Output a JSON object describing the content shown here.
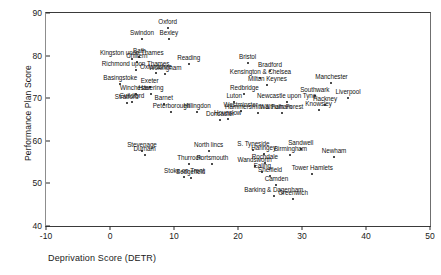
{
  "chart_data": {
    "type": "scatter",
    "title": "",
    "xlabel": "Deprivation Score (DETR)",
    "ylabel": "Performance Plan Score",
    "xlim": [
      -10,
      50
    ],
    "ylim": [
      40,
      90
    ],
    "xticks": [
      -10,
      0,
      10,
      20,
      30,
      40,
      50
    ],
    "yticks": [
      40,
      50,
      60,
      70,
      80,
      90
    ],
    "grid": false,
    "legend": null,
    "marker_color": "#111111",
    "axis_color": "#2b2b2b",
    "points": [
      {
        "label": "Oxford",
        "x": 9.0,
        "y": 86.5
      },
      {
        "label": "Swindon",
        "x": 5.0,
        "y": 84.0
      },
      {
        "label": "Bexley",
        "x": 9.2,
        "y": 84.0
      },
      {
        "label": "Bath",
        "x": 4.6,
        "y": 79.6
      },
      {
        "label": "Kingston upon Thames",
        "x": 3.4,
        "y": 79.2
      },
      {
        "label": "Chiltern",
        "x": 4.2,
        "y": 78.6
      },
      {
        "label": "Reading",
        "x": 12.3,
        "y": 78.0
      },
      {
        "label": "Bristol",
        "x": 21.5,
        "y": 78.2
      },
      {
        "label": "Richmond upon Thames",
        "x": 4.0,
        "y": 76.6
      },
      {
        "label": "Oxfordshire",
        "x": 7.2,
        "y": 76.0
      },
      {
        "label": "Wokingham",
        "x": 8.6,
        "y": 75.6
      },
      {
        "label": "Bradford",
        "x": 25.0,
        "y": 76.4
      },
      {
        "label": "Kensington & Chelsea",
        "x": 23.5,
        "y": 74.8
      },
      {
        "label": "Basingstoke",
        "x": 1.6,
        "y": 73.4
      },
      {
        "label": "Exeter",
        "x": 6.2,
        "y": 72.6
      },
      {
        "label": "Milton Keynes",
        "x": 24.6,
        "y": 73.0
      },
      {
        "label": "Manchester",
        "x": 34.6,
        "y": 73.6
      },
      {
        "label": "Winchester",
        "x": 4.0,
        "y": 71.0
      },
      {
        "label": "Havering",
        "x": 6.4,
        "y": 71.0
      },
      {
        "label": "Redbridge",
        "x": 21.0,
        "y": 71.0
      },
      {
        "label": "Southwark",
        "x": 32.0,
        "y": 70.6
      },
      {
        "label": "Liverpool",
        "x": 37.2,
        "y": 70.0
      },
      {
        "label": "Guildford",
        "x": 3.4,
        "y": 69.0
      },
      {
        "label": "Stratford",
        "x": 2.6,
        "y": 68.8
      },
      {
        "label": "Barnet",
        "x": 8.4,
        "y": 68.6
      },
      {
        "label": "Luton",
        "x": 19.4,
        "y": 69.0
      },
      {
        "label": "Newcastle upon Tyne",
        "x": 27.6,
        "y": 69.2
      },
      {
        "label": "Hackney",
        "x": 33.6,
        "y": 68.4
      },
      {
        "label": "Knowsley",
        "x": 32.6,
        "y": 67.2
      },
      {
        "label": "Peterborough",
        "x": 9.6,
        "y": 66.8
      },
      {
        "label": "Hillingdon",
        "x": 13.6,
        "y": 66.8
      },
      {
        "label": "Westminster",
        "x": 20.4,
        "y": 67.0
      },
      {
        "label": "Hammersmith & Fulham",
        "x": 23.2,
        "y": 66.6
      },
      {
        "label": "Waltham Forest",
        "x": 26.8,
        "y": 66.6
      },
      {
        "label": "Hounslow",
        "x": 18.4,
        "y": 65.2
      },
      {
        "label": "Doncaster",
        "x": 17.2,
        "y": 65.0
      },
      {
        "label": "Stevenage",
        "x": 5.0,
        "y": 57.6
      },
      {
        "label": "Durham",
        "x": 5.4,
        "y": 56.6
      },
      {
        "label": "North lincs",
        "x": 15.4,
        "y": 57.6
      },
      {
        "label": "S. Tyneside",
        "x": 22.4,
        "y": 57.8
      },
      {
        "label": "Sandwell",
        "x": 29.8,
        "y": 58.0
      },
      {
        "label": "Haringey",
        "x": 24.0,
        "y": 56.8
      },
      {
        "label": "Birmingham",
        "x": 28.2,
        "y": 56.6
      },
      {
        "label": "Newham",
        "x": 35.0,
        "y": 56.2
      },
      {
        "label": "Thurrock",
        "x": 12.4,
        "y": 54.6
      },
      {
        "label": "Portsmouth",
        "x": 16.0,
        "y": 54.6
      },
      {
        "label": "Rochdale",
        "x": 24.2,
        "y": 54.8
      },
      {
        "label": "Wandsworth",
        "x": 22.6,
        "y": 54.2
      },
      {
        "label": "Ealing",
        "x": 23.8,
        "y": 52.6
      },
      {
        "label": "Sheffield",
        "x": 25.0,
        "y": 51.8
      },
      {
        "label": "Tower Hamlets",
        "x": 31.6,
        "y": 52.2
      },
      {
        "label": "Stoke on Trent",
        "x": 11.6,
        "y": 51.4
      },
      {
        "label": "Sedgefield",
        "x": 12.6,
        "y": 51.2
      },
      {
        "label": "Camden",
        "x": 26.0,
        "y": 49.6
      },
      {
        "label": "Barking & Dagenham",
        "x": 25.6,
        "y": 47.0
      },
      {
        "label": "Greenwich",
        "x": 28.6,
        "y": 46.4
      }
    ]
  }
}
